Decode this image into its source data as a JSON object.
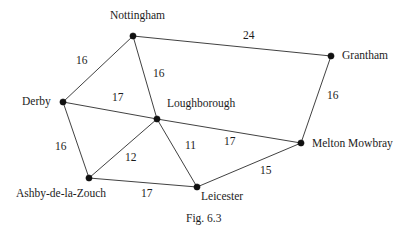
{
  "figure": {
    "caption": "Fig. 6.3",
    "caption_pos": {
      "x": 186,
      "y": 213
    },
    "background": "#ffffff",
    "line_color": "#2b2b2b",
    "node_color": "#111111",
    "text_color": "#1c1c1c"
  },
  "chart_data": {
    "type": "diagram",
    "title": "Fig. 6.3",
    "nodes": [
      {
        "id": "nottingham",
        "label": "Nottingham",
        "x": 133,
        "y": 36,
        "label_x": 110,
        "label_y": 10,
        "label_anchor": "start"
      },
      {
        "id": "grantham",
        "label": "Grantham",
        "x": 331,
        "y": 56,
        "label_x": 342,
        "label_y": 50,
        "label_anchor": "start"
      },
      {
        "id": "derby",
        "label": "Derby",
        "x": 63,
        "y": 102,
        "label_x": 22,
        "label_y": 96,
        "label_anchor": "start"
      },
      {
        "id": "loughborough",
        "label": "Loughborough",
        "x": 157,
        "y": 119,
        "label_x": 167,
        "label_y": 98,
        "label_anchor": "start"
      },
      {
        "id": "melton",
        "label": "Melton Mowbray",
        "x": 301,
        "y": 143,
        "label_x": 312,
        "label_y": 138,
        "label_anchor": "start"
      },
      {
        "id": "ashby",
        "label": "Ashby-de-la-Zouch",
        "x": 89,
        "y": 178,
        "label_x": 16,
        "label_y": 188,
        "label_anchor": "start"
      },
      {
        "id": "leicester",
        "label": "Leicester",
        "x": 197,
        "y": 187,
        "label_x": 201,
        "label_y": 191,
        "label_anchor": "start"
      }
    ],
    "edges": [
      {
        "from": "derby",
        "to": "nottingham",
        "weight": 16,
        "label_x": 76,
        "label_y": 55
      },
      {
        "from": "nottingham",
        "to": "grantham",
        "weight": 24,
        "label_x": 243,
        "label_y": 30
      },
      {
        "from": "nottingham",
        "to": "loughborough",
        "weight": 16,
        "label_x": 153,
        "label_y": 68
      },
      {
        "from": "derby",
        "to": "loughborough",
        "weight": 17,
        "label_x": 112,
        "label_y": 92
      },
      {
        "from": "grantham",
        "to": "melton",
        "weight": 16,
        "label_x": 327,
        "label_y": 90
      },
      {
        "from": "derby",
        "to": "ashby",
        "weight": 16,
        "label_x": 55,
        "label_y": 141
      },
      {
        "from": "ashby",
        "to": "loughborough",
        "weight": 12,
        "label_x": 125,
        "label_y": 152
      },
      {
        "from": "loughborough",
        "to": "leicester",
        "weight": 11,
        "label_x": 185,
        "label_y": 140
      },
      {
        "from": "loughborough",
        "to": "melton",
        "weight": 17,
        "label_x": 224,
        "label_y": 136
      },
      {
        "from": "ashby",
        "to": "leicester",
        "weight": 17,
        "label_x": 141,
        "label_y": 188
      },
      {
        "from": "leicester",
        "to": "melton",
        "weight": 15,
        "label_x": 260,
        "label_y": 165
      }
    ],
    "node_radius": 3.1,
    "xlim": [
      0,
      418
    ],
    "ylim": [
      0,
      242
    ],
    "grid": false,
    "legend": false
  }
}
